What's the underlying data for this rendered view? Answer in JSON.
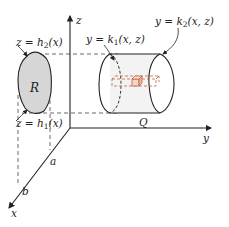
{
  "figure": {
    "axes": {
      "z_label": "z",
      "y_label": "y",
      "x_label": "x",
      "x_ticks": [
        "a",
        "b"
      ]
    },
    "region": {
      "label": "R",
      "upper_boundary": {
        "lhs": "z = h",
        "sub": "2",
        "rhs": "(x)"
      },
      "lower_boundary": {
        "lhs": "z = h",
        "sub": "1",
        "rhs": "(x)"
      }
    },
    "solid": {
      "label": "Q",
      "left_surface": {
        "lhs": "y = k",
        "sub": "1",
        "rhs": "(x, z)"
      },
      "right_surface": {
        "lhs": "y = k",
        "sub": "2",
        "rhs": "(x, z)"
      }
    },
    "colors": {
      "region_fill": "#d8d8d8",
      "cylinder_fill": "#f4f4f4",
      "prism": "#c0623c",
      "ink": "#222222"
    },
    "caption": ""
  }
}
